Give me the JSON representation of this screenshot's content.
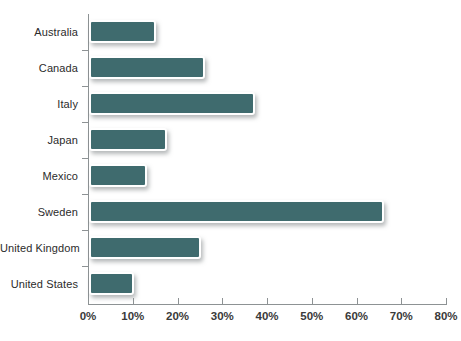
{
  "chart_data": {
    "type": "bar",
    "orientation": "horizontal",
    "title": "",
    "subtitle": "",
    "xlabel": "",
    "ylabel": "",
    "categories": [
      "Australia",
      "Canada",
      "Italy",
      "Japan",
      "Mexico",
      "Sweden",
      "United Kingdom",
      "United States"
    ],
    "values": [
      15,
      26,
      37,
      17.5,
      13,
      66,
      25,
      10
    ],
    "value_suffix": "%",
    "xlim": [
      0,
      80
    ],
    "xticks": [
      0,
      10,
      20,
      30,
      40,
      50,
      60,
      70,
      80
    ],
    "xtick_labels": [
      "0%",
      "10%",
      "20%",
      "30%",
      "40%",
      "50%",
      "60%",
      "70%",
      "80%"
    ],
    "grid": false,
    "legend": null,
    "series": [
      {
        "name": "",
        "color": "#3f6b6e",
        "values": [
          15,
          26,
          37,
          17.5,
          13,
          66,
          25,
          10
        ]
      }
    ]
  },
  "style": {
    "bar_color": "#3f6b6e",
    "bar_border_color": "#ffffff",
    "axis_color": "#8d9294",
    "label_color": "#2b2b2b",
    "background": "#ffffff"
  }
}
